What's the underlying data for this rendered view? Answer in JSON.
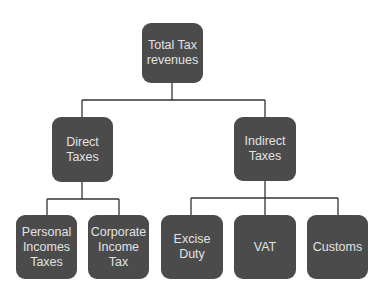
{
  "diagram": {
    "type": "tree",
    "colors": {
      "node_fill": "#4b4b4b",
      "node_text": "#e2e2e2",
      "connector": "#333333",
      "background": "#ffffff"
    },
    "root": {
      "label": "Total Tax\nrevenues"
    },
    "level1": [
      {
        "label": "Direct\nTaxes"
      },
      {
        "label": "Indirect\nTaxes"
      }
    ],
    "direct_children": [
      {
        "label": "Personal\nIncomes\nTaxes"
      },
      {
        "label": "Corporate\nIncome\nTax"
      }
    ],
    "indirect_children": [
      {
        "label": "Excise\nDuty"
      },
      {
        "label": "VAT"
      },
      {
        "label": "Customs"
      }
    ]
  }
}
